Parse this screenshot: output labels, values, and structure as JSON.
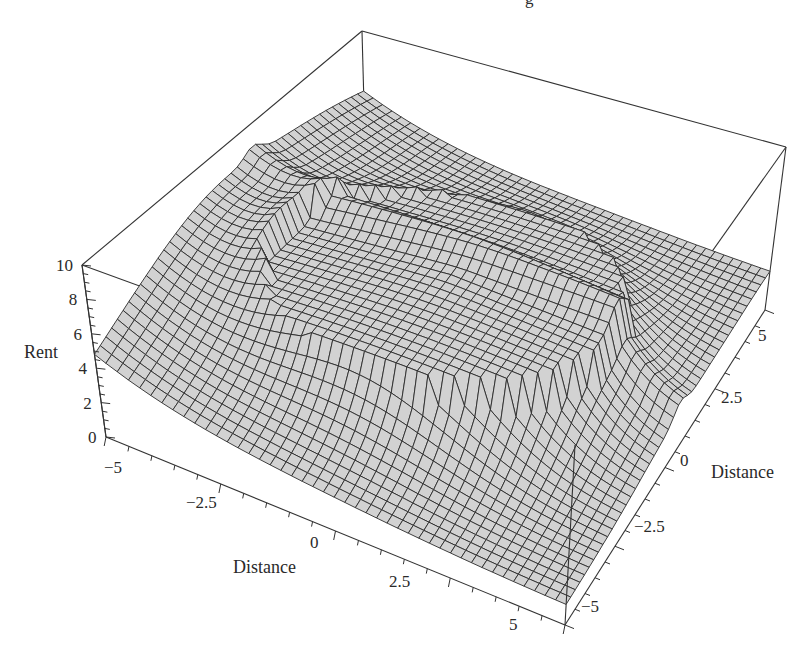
{
  "chart_data": {
    "type": "surface3d",
    "title": "",
    "top_partial_text": "g",
    "zlabel": "Rent",
    "xlabel": "Distance",
    "ylabel": "Distance",
    "x_range": [
      -5,
      5
    ],
    "y_range": [
      -5,
      5
    ],
    "z_range": [
      0,
      10
    ],
    "z_ticks": [
      "0",
      "2",
      "4",
      "6",
      "8",
      "10"
    ],
    "z_tick_values": [
      0,
      2,
      4,
      6,
      8,
      10
    ],
    "x_ticks": [
      "−5",
      "−2.5",
      "0",
      "2.5",
      "5"
    ],
    "x_tick_values": [
      -5,
      -2.5,
      0,
      2.5,
      5
    ],
    "y_ticks": [
      "−5",
      "−2.5",
      "0",
      "2.5",
      "5"
    ],
    "y_tick_values": [
      -5,
      -2.5,
      0,
      2.5,
      5
    ],
    "grid": false,
    "legend": null,
    "surface_description": "Rent surface: central elliptical plateau (~rent 6-7) bounded by a sharp ring, a linear ridge along one Distance axis (~rent 8-9 at edge), rent declining toward corners (~0.5-1)",
    "sample_values": [
      {
        "x": 0,
        "y": 0,
        "z": 6.5
      },
      {
        "x": -5,
        "y": 0,
        "z": 8.5
      },
      {
        "x": 5,
        "y": 5,
        "z": 1.0
      },
      {
        "x": -5,
        "y": -5,
        "z": 0.5
      },
      {
        "x": 5,
        "y": -5,
        "z": 1.0
      },
      {
        "x": -5,
        "y": 5,
        "z": 2.5
      }
    ],
    "colors": {
      "surface_fill": "#d2d2d2",
      "mesh_line": "#2b2b2b",
      "box_line": "#333333",
      "text": "#2a2a2a"
    }
  }
}
